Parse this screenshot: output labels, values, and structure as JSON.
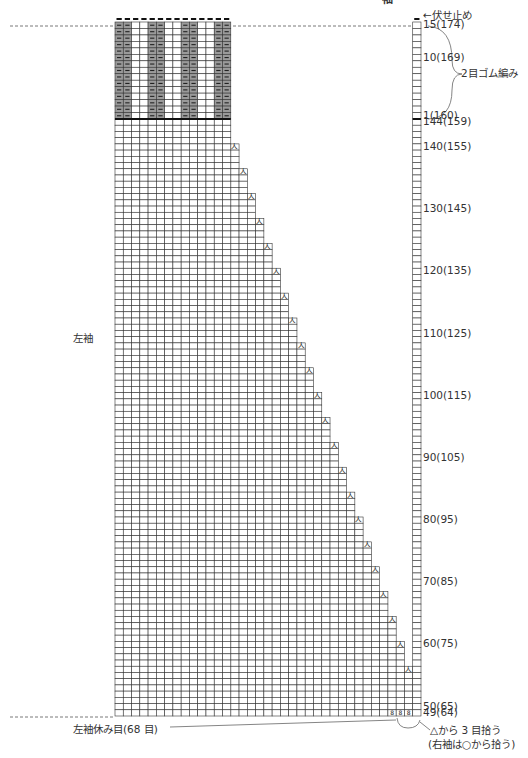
{
  "title_fragment": "袖",
  "labels": {
    "left_sleeve": "左袖",
    "bind_off": "←伏せ止め",
    "ribbing": "2目ゴム編み",
    "held_stitches": "左袖休み目(68 目)",
    "pickup_note_1": "△から 3 目拾う",
    "pickup_note_2": "(右袖は○から拾う)"
  },
  "row_labels": [
    {
      "row": 15,
      "text": "15(174)"
    },
    {
      "row": 10,
      "text": "10(169)"
    },
    {
      "row": 1,
      "text": "1(160)"
    },
    {
      "row": 144,
      "text": "144(159)"
    },
    {
      "row": 140,
      "text": "140(155)"
    },
    {
      "row": 130,
      "text": "130(145)"
    },
    {
      "row": 120,
      "text": "120(135)"
    },
    {
      "row": 110,
      "text": "110(125)"
    },
    {
      "row": 100,
      "text": "100(115)"
    },
    {
      "row": 90,
      "text": "90(105)"
    },
    {
      "row": 80,
      "text": "80(95)"
    },
    {
      "row": 70,
      "text": "70(85)"
    },
    {
      "row": 60,
      "text": "60(75)"
    },
    {
      "row": 50,
      "text": "50(65)"
    },
    {
      "row": 49,
      "text": "49(64)"
    }
  ],
  "grid": {
    "columns": 37,
    "ribbing_rows": 15,
    "ribbing_columns": 14,
    "ribbing_pattern": [
      "purl",
      "purl",
      "knit",
      "knit",
      "purl",
      "purl",
      "knit",
      "knit",
      "purl",
      "purl",
      "knit",
      "knit",
      "purl",
      "purl"
    ],
    "body_top_row": 144,
    "body_bottom_row": 49,
    "staircase_steps": 22,
    "rows_per_step": 4,
    "pickup_cells": 3
  },
  "symbols": {
    "purl": "—",
    "decrease": "人",
    "pickup": "8",
    "bind_off": "—"
  },
  "colors": {
    "purl_fill": "#9a9a9a",
    "grid_line": "#333333",
    "thick_line": "#111111",
    "dashed": "#555555"
  }
}
